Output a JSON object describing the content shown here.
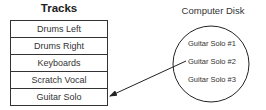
{
  "tracks": {
    "title": "Tracks",
    "items": [
      "Drums Left",
      "Drums Right",
      "Keyboards",
      "Scratch Vocal",
      "Guitar Solo"
    ]
  },
  "disk": {
    "title": "Computer Disk",
    "items": [
      "Guitar Solo #1",
      "Guitar Solo #2",
      "Guitar Solo #3"
    ]
  },
  "arrow": {
    "from": "Guitar Solo #2",
    "to": "Guitar Solo"
  }
}
